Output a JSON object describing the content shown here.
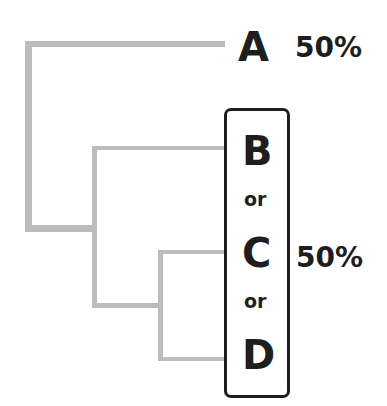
{
  "diagram": {
    "type": "phylogenetic-tree",
    "leaves": [
      {
        "label": "A",
        "probability": "50%"
      },
      {
        "label": "B"
      },
      {
        "label": "C"
      },
      {
        "label": "D"
      }
    ],
    "group": {
      "members": [
        "B",
        "C",
        "D"
      ],
      "separator": "or",
      "probability": "50%"
    },
    "colors": {
      "branch": "#bcbcbc",
      "text": "#1e1e1e",
      "box_border": "#1e1e1e"
    }
  }
}
